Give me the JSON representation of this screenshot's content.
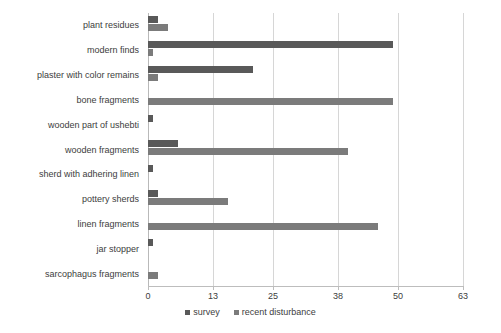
{
  "chart_data": {
    "type": "bar",
    "orientation": "horizontal",
    "title": "",
    "subtitle": "",
    "xlabel": "",
    "ylabel": "",
    "xlim": [
      0,
      63
    ],
    "ylim": null,
    "grid": true,
    "gridlines_axis": "x",
    "legend_position": "bottom-center",
    "xticks": [
      0,
      13,
      25,
      38,
      50,
      63
    ],
    "xtick_labels": [
      "0",
      "13",
      "25",
      "38",
      "50",
      "63"
    ],
    "categories": [
      "plant residues",
      "modern finds",
      "plaster with color remains",
      "bone fragments",
      "wooden part of ushebti",
      "wooden fragments",
      "sherd with adhering linen",
      "pottery sherds",
      "linen fragments",
      "jar stopper",
      "sarcophagus fragments"
    ],
    "series": [
      {
        "name": "survey",
        "color": "#595959",
        "values": [
          2,
          49,
          21,
          0,
          1,
          6,
          1,
          2,
          0,
          1,
          0
        ]
      },
      {
        "name": "recent disturbance",
        "color": "#7b7b7b",
        "values": [
          4,
          1,
          2,
          49,
          0,
          40,
          0,
          16,
          46,
          0,
          2
        ]
      }
    ]
  },
  "legend": {
    "items": [
      {
        "label": "survey",
        "series": "survey"
      },
      {
        "label": "recent disturbance",
        "series": "recent"
      }
    ]
  }
}
